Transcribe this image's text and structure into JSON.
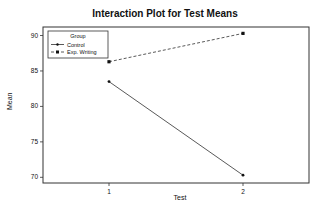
{
  "chart_data": {
    "type": "line",
    "title": "Interaction Plot for Test Means",
    "xlabel": "Test",
    "ylabel": "Mean",
    "categories": [
      "1",
      "2"
    ],
    "series": [
      {
        "name": "Control",
        "values": [
          83.5,
          70.3
        ],
        "style": "solid",
        "marker": "circle"
      },
      {
        "name": "Exp. Writing",
        "values": [
          86.3,
          90.3
        ],
        "style": "dashed",
        "marker": "square"
      }
    ],
    "yticks": [
      70,
      75,
      80,
      85,
      90
    ],
    "ylim": [
      69.2,
      91.2
    ],
    "legend": {
      "title": "Group",
      "position": "upper-left"
    },
    "grid": false
  }
}
